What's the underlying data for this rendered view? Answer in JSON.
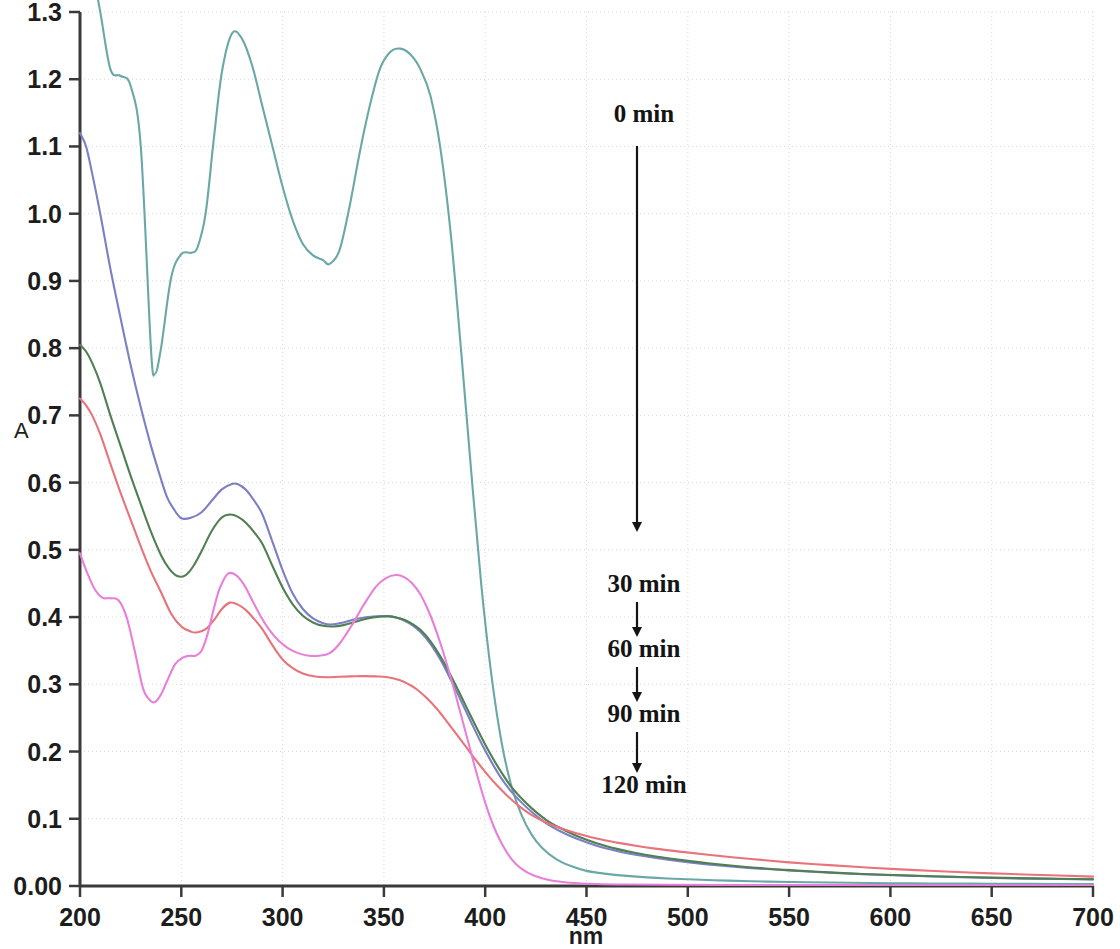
{
  "figure": {
    "kind": "uv-vis-absorption-spectra",
    "background_color": "#ffffff"
  },
  "axes": {
    "y_title": "A",
    "x_title": "nm",
    "y_ticks": [
      "0.00",
      "0.1",
      "0.2",
      "0.3",
      "0.4",
      "0.5",
      "0.6",
      "0.7",
      "0.8",
      "0.9",
      "1.0",
      "1.1",
      "1.2",
      "1.3"
    ],
    "x_ticks": [
      "200",
      "250",
      "300",
      "350",
      "400",
      "450",
      "500",
      "550",
      "600",
      "650",
      "700"
    ]
  },
  "annotations": [
    {
      "label": "0 min",
      "x": 644,
      "y": 122
    },
    {
      "label": "30 min",
      "x": 644,
      "y": 592
    },
    {
      "label": "60 min",
      "x": 644,
      "y": 657
    },
    {
      "label": "90 min",
      "x": 644,
      "y": 722
    },
    {
      "label": "120 min",
      "x": 644,
      "y": 793
    }
  ],
  "arrows": [
    {
      "name": "arrow-0-to-30",
      "x": 637,
      "y1": 146,
      "y2": 532
    },
    {
      "name": "arrow-30-to-60",
      "x": 637,
      "y1": 602,
      "y2": 637
    },
    {
      "name": "arrow-60-to-90",
      "x": 637,
      "y1": 667,
      "y2": 702
    },
    {
      "name": "arrow-90-to-120",
      "x": 637,
      "y1": 732,
      "y2": 773
    }
  ],
  "chart_data": {
    "type": "line",
    "title": "",
    "xlabel": "nm",
    "ylabel": "A",
    "xlim": [
      200,
      700
    ],
    "ylim": [
      0.0,
      1.3
    ],
    "xticks": [
      200,
      250,
      300,
      350,
      400,
      450,
      500,
      550,
      600,
      650,
      700
    ],
    "yticks": [
      0.0,
      0.1,
      0.2,
      0.3,
      0.4,
      0.5,
      0.6,
      0.7,
      0.8,
      0.9,
      1.0,
      1.1,
      1.2,
      1.3
    ],
    "grid": true,
    "legend": "annotated-arrow-sequence",
    "series": [
      {
        "name": "0 min",
        "color": "#6aa8a8",
        "x": [
          200,
          205,
          210,
          215,
          220,
          225,
          230,
          235,
          237,
          240,
          245,
          250,
          255,
          258,
          262,
          266,
          270,
          275,
          280,
          285,
          290,
          295,
          300,
          305,
          310,
          315,
          320,
          323,
          328,
          333,
          338,
          343,
          348,
          353,
          358,
          363,
          368,
          373,
          378,
          383,
          388,
          393,
          398,
          403,
          408,
          413,
          418,
          423,
          428,
          435,
          442,
          450,
          460,
          470,
          480,
          490,
          500,
          520,
          540,
          560,
          580,
          600,
          620,
          640,
          660,
          680,
          700
        ],
        "y": [
          1.44,
          1.38,
          1.3,
          1.215,
          1.205,
          1.19,
          1.1,
          0.8,
          0.762,
          0.8,
          0.905,
          0.94,
          0.942,
          0.95,
          1.0,
          1.11,
          1.21,
          1.268,
          1.26,
          1.22,
          1.16,
          1.1,
          1.04,
          0.99,
          0.955,
          0.938,
          0.931,
          0.925,
          0.945,
          1.01,
          1.09,
          1.16,
          1.215,
          1.24,
          1.2455,
          1.237,
          1.215,
          1.175,
          1.095,
          0.97,
          0.8,
          0.62,
          0.45,
          0.315,
          0.215,
          0.148,
          0.105,
          0.076,
          0.057,
          0.04,
          0.03,
          0.0225,
          0.018,
          0.015,
          0.0128,
          0.0112,
          0.01,
          0.008,
          0.0065,
          0.0055,
          0.0048,
          0.0042,
          0.0038,
          0.0035,
          0.0032,
          0.003,
          0.0028
        ]
      },
      {
        "name": "30 min",
        "color": "#7b7fc4",
        "x": [
          200,
          203,
          206,
          210,
          215,
          220,
          225,
          230,
          235,
          240,
          243,
          246,
          250,
          255,
          260,
          265,
          270,
          275,
          278,
          282,
          286,
          290,
          295,
          300,
          305,
          310,
          315,
          320,
          324,
          330,
          336,
          342,
          348,
          352,
          356,
          360,
          364,
          368,
          373,
          378,
          383,
          388,
          393,
          398,
          403,
          408,
          413,
          418,
          423,
          430,
          437,
          445,
          455,
          465,
          475,
          485,
          495,
          510,
          530,
          550,
          570,
          590,
          610,
          630,
          650,
          670,
          700
        ],
        "y": [
          1.12,
          1.1,
          1.06,
          1.0,
          0.918,
          0.845,
          0.775,
          0.712,
          0.655,
          0.605,
          0.578,
          0.562,
          0.547,
          0.548,
          0.556,
          0.573,
          0.59,
          0.598,
          0.5975,
          0.589,
          0.573,
          0.553,
          0.512,
          0.47,
          0.435,
          0.412,
          0.398,
          0.391,
          0.389,
          0.392,
          0.397,
          0.4,
          0.4015,
          0.4015,
          0.3995,
          0.395,
          0.388,
          0.378,
          0.36,
          0.336,
          0.307,
          0.276,
          0.244,
          0.213,
          0.185,
          0.16,
          0.14,
          0.124,
          0.11,
          0.0935,
          0.0815,
          0.0705,
          0.0598,
          0.052,
          0.046,
          0.0412,
          0.0373,
          0.0322,
          0.027,
          0.023,
          0.0198,
          0.0172,
          0.0152,
          0.0135,
          0.012,
          0.011,
          0.0098
        ]
      },
      {
        "name": "60 min",
        "color": "#4f7f52",
        "x": [
          200,
          203,
          206,
          210,
          215,
          220,
          225,
          230,
          235,
          240,
          244,
          248,
          252,
          256,
          260,
          265,
          270,
          274,
          278,
          282,
          286,
          290,
          295,
          300,
          305,
          310,
          315,
          320,
          325,
          330,
          336,
          342,
          348,
          352,
          356,
          360,
          364,
          368,
          373,
          378,
          383,
          388,
          393,
          398,
          403,
          408,
          413,
          418,
          423,
          430,
          437,
          445,
          455,
          465,
          475,
          485,
          495,
          510,
          530,
          550,
          570,
          590,
          610,
          630,
          650,
          670,
          700
        ],
        "y": [
          0.805,
          0.795,
          0.778,
          0.748,
          0.7,
          0.655,
          0.61,
          0.568,
          0.527,
          0.492,
          0.472,
          0.461,
          0.462,
          0.476,
          0.498,
          0.528,
          0.548,
          0.5525,
          0.549,
          0.54,
          0.526,
          0.509,
          0.476,
          0.444,
          0.419,
          0.402,
          0.392,
          0.387,
          0.386,
          0.388,
          0.393,
          0.398,
          0.4005,
          0.401,
          0.3995,
          0.396,
          0.39,
          0.381,
          0.364,
          0.341,
          0.313,
          0.283,
          0.252,
          0.222,
          0.194,
          0.169,
          0.147,
          0.13,
          0.1155,
          0.0985,
          0.0862,
          0.0748,
          0.0636,
          0.0552,
          0.0487,
          0.0436,
          0.0394,
          0.0338,
          0.028,
          0.0236,
          0.0202,
          0.0175,
          0.0155,
          0.0138,
          0.0124,
          0.0113,
          0.01
        ]
      },
      {
        "name": "90 min",
        "color": "#e8737b",
        "x": [
          200,
          203,
          206,
          210,
          215,
          220,
          225,
          230,
          235,
          240,
          245,
          250,
          255,
          258,
          262,
          266,
          270,
          274,
          278,
          282,
          286,
          290,
          295,
          300,
          305,
          310,
          316,
          322,
          328,
          334,
          340,
          346,
          352,
          358,
          362,
          366,
          371,
          376,
          381,
          386,
          391,
          396,
          401,
          406,
          411,
          417,
          423,
          430,
          437,
          445,
          455,
          465,
          475,
          485,
          495,
          510,
          530,
          550,
          570,
          590,
          610,
          630,
          650,
          670,
          700
        ],
        "y": [
          0.725,
          0.715,
          0.7,
          0.672,
          0.628,
          0.585,
          0.545,
          0.505,
          0.468,
          0.437,
          0.405,
          0.386,
          0.378,
          0.3775,
          0.382,
          0.395,
          0.412,
          0.4215,
          0.4185,
          0.41,
          0.397,
          0.382,
          0.358,
          0.337,
          0.324,
          0.316,
          0.3115,
          0.3105,
          0.3112,
          0.3118,
          0.3122,
          0.3118,
          0.3105,
          0.306,
          0.3005,
          0.293,
          0.28,
          0.264,
          0.245,
          0.225,
          0.205,
          0.185,
          0.166,
          0.149,
          0.134,
          0.118,
          0.1055,
          0.0945,
          0.0862,
          0.0785,
          0.0705,
          0.0645,
          0.0595,
          0.0552,
          0.0515,
          0.0465,
          0.0405,
          0.0352,
          0.031,
          0.0272,
          0.024,
          0.0212,
          0.0188,
          0.0168,
          0.014
        ]
      },
      {
        "name": "120 min",
        "color": "#e87fd8",
        "x": [
          200,
          203,
          207,
          211,
          215,
          219,
          223,
          227,
          231,
          234,
          237,
          240,
          243,
          247,
          251,
          254,
          257,
          260,
          263,
          266,
          269,
          273,
          277,
          281,
          285,
          289,
          293,
          298,
          303,
          308,
          313,
          318,
          323,
          328,
          334,
          340,
          346,
          351,
          356,
          360,
          364,
          368,
          373,
          378,
          383,
          388,
          392,
          396,
          400,
          404,
          408,
          413,
          418,
          424,
          432,
          442,
          455,
          470,
          490,
          520,
          560,
          600,
          650,
          700
        ],
        "y": [
          0.495,
          0.47,
          0.443,
          0.429,
          0.428,
          0.425,
          0.4,
          0.35,
          0.295,
          0.278,
          0.2735,
          0.285,
          0.305,
          0.33,
          0.34,
          0.3425,
          0.3425,
          0.35,
          0.375,
          0.412,
          0.443,
          0.4645,
          0.4625,
          0.448,
          0.425,
          0.402,
          0.383,
          0.365,
          0.353,
          0.346,
          0.3425,
          0.3425,
          0.346,
          0.36,
          0.387,
          0.418,
          0.445,
          0.458,
          0.4625,
          0.4595,
          0.45,
          0.434,
          0.402,
          0.36,
          0.31,
          0.255,
          0.21,
          0.165,
          0.124,
          0.09,
          0.064,
          0.04,
          0.0255,
          0.0155,
          0.0085,
          0.0048,
          0.003,
          0.0022,
          0.0018,
          0.0015,
          0.0013,
          0.0012,
          0.0011,
          0.001
        ]
      }
    ]
  }
}
